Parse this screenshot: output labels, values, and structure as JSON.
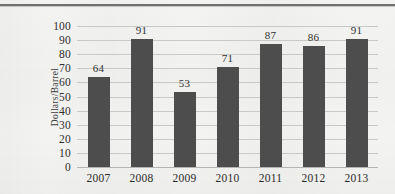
{
  "chart_data": {
    "type": "bar",
    "title": "",
    "xlabel": "",
    "ylabel": "Dollars/Barrel",
    "categories": [
      "2007",
      "2008",
      "2009",
      "2010",
      "2011",
      "2012",
      "2013"
    ],
    "values": [
      64,
      91,
      53,
      71,
      87,
      86,
      91
    ],
    "value_labels": [
      "64",
      "91",
      "53",
      "71",
      "87",
      "86",
      "91"
    ],
    "ylim": [
      0,
      100
    ],
    "ytick_step": 10,
    "yticks": [
      "100",
      "90",
      "80",
      "70",
      "60",
      "50",
      "40",
      "30",
      "20",
      "10",
      "0"
    ],
    "ytick_values": [
      100,
      90,
      80,
      70,
      60,
      50,
      40,
      30,
      20,
      10,
      0
    ],
    "grid": "horizontal",
    "legend": "none",
    "series": [
      {
        "name": "Dollars/Barrel",
        "values": [
          64,
          91,
          53,
          71,
          87,
          86,
          91
        ],
        "color": "#4d4d4d"
      }
    ],
    "colors": {
      "bar": "#4d4d4d",
      "gridline": "#c9c9c7",
      "background": "#f3f3f1",
      "text": "#2e2e2e",
      "top_rule": "#5a5a5c"
    }
  }
}
